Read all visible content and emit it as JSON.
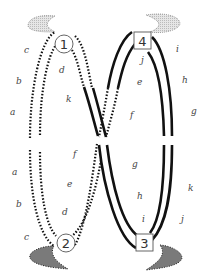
{
  "diagram": {
    "title": "",
    "nodes": [
      {
        "id": "1",
        "label": "1",
        "shape": "circle"
      },
      {
        "id": "2",
        "label": "2",
        "shape": "circle"
      },
      {
        "id": "3",
        "label": "3",
        "shape": "square"
      },
      {
        "id": "4",
        "label": "4",
        "shape": "square"
      }
    ],
    "left_labels_top": [
      "c",
      "b",
      "a"
    ],
    "left_labels_bottom": [
      "a",
      "b",
      "c"
    ],
    "inner_left_top": [
      "d",
      "k"
    ],
    "inner_left_bottom": [
      "f",
      "e",
      "d"
    ],
    "inner_right_top": [
      "j",
      "e",
      "f"
    ],
    "inner_right_bottom": [
      "g",
      "h",
      "i"
    ],
    "right_labels_top": [
      "i",
      "h",
      "g"
    ],
    "right_labels_bottom": [
      "k",
      "j"
    ],
    "colors": {
      "line": "#111111",
      "shade_light": "#cccccc",
      "shade_dark": "#777777",
      "label": "#444444"
    },
    "line_styles": {
      "dotted": "dotted strand",
      "solid": "solid strand"
    }
  }
}
